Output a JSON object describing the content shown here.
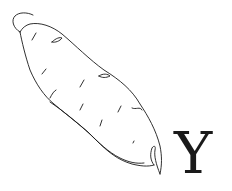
{
  "illustration": {
    "subject": "yam (sweet potato) line drawing",
    "letter": "Y",
    "colors": {
      "line": "#1a1a1a",
      "background": "#ffffff"
    }
  }
}
